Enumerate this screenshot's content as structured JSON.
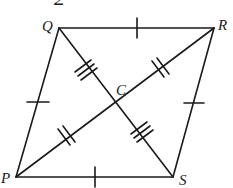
{
  "figure": {
    "type": "rhombus with diagonals",
    "stroke_color": "#1a1a1a",
    "background": "#ffffff",
    "cropped_top_glyph": "2",
    "vertices": {
      "Q": {
        "label": "Q",
        "x": 59,
        "y": 28
      },
      "R": {
        "label": "R",
        "x": 214,
        "y": 28
      },
      "S": {
        "label": "S",
        "x": 173,
        "y": 177
      },
      "P": {
        "label": "P",
        "x": 16,
        "y": 177
      }
    },
    "center": {
      "label": "C",
      "x": 115,
      "y": 102
    },
    "sides": [
      {
        "from": "Q",
        "to": "R",
        "tick_marks": 1
      },
      {
        "from": "R",
        "to": "S",
        "tick_marks": 1
      },
      {
        "from": "S",
        "to": "P",
        "tick_marks": 1
      },
      {
        "from": "P",
        "to": "Q",
        "tick_marks": 1
      }
    ],
    "diagonal_segments": [
      {
        "from": "Q",
        "to": "C",
        "tick_marks": 3
      },
      {
        "from": "C",
        "to": "S",
        "tick_marks": 3
      },
      {
        "from": "P",
        "to": "C",
        "tick_marks": 2
      },
      {
        "from": "C",
        "to": "R",
        "tick_marks": 2
      }
    ]
  }
}
